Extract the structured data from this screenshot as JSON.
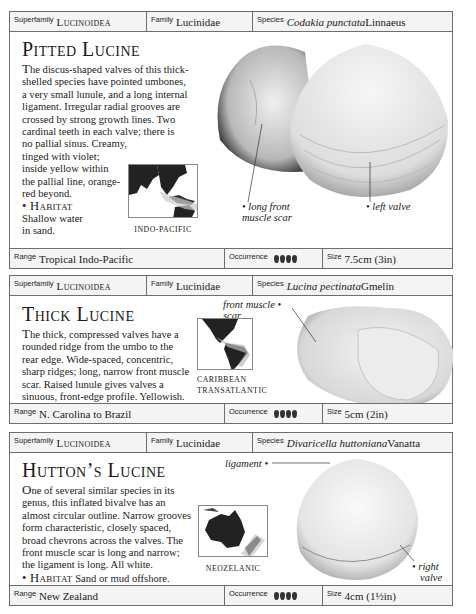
{
  "labels": {
    "superfamily": "Superfamily",
    "family": "Family",
    "species": "Species",
    "range": "Range",
    "occurrence": "Occurrence",
    "size": "Size",
    "habitat": "• Habitat"
  },
  "entries": [
    {
      "superfamily": "Lucinoidea",
      "family": "Lucinidae",
      "species_italic": "Codakia punctata",
      "species_author": " Linnaeus",
      "title": "Pitted Lucine",
      "desc_first": "T",
      "desc_l1": "he discus-shaped valves of this thick-",
      "desc_l2": "shelled species have pointed umbones,",
      "desc_l3": "a very small lunule, and a long internal",
      "desc_l4": "ligament. Irregular radial grooves are",
      "desc_l5": "crossed by strong growth lines. Two",
      "desc_l6": "cardinal teeth in each valve; there is",
      "desc_l7": "no pallial sinus. Creamy,",
      "desc_l8": "tinged with violet;",
      "desc_l9": "inside yellow within",
      "desc_l10": "the pallial line, orange-",
      "desc_l11": "red beyond.",
      "habitat_l1": "Shallow water",
      "habitat_l2": "in sand.",
      "map_label": "INDO-PACIFIC",
      "annotations": [
        "long front",
        "muscle scar",
        "left valve"
      ],
      "range": "Tropical Indo-Pacific",
      "occurrence_count": 4,
      "size": "7.5cm (3in)"
    },
    {
      "superfamily": "Lucinoidea",
      "family": "Lucinidae",
      "species_italic": "Lucina pectinata",
      "species_author": " Gmelin",
      "title": "Thick Lucine",
      "desc_first": "T",
      "desc_l1": "he thick, compressed valves have a",
      "desc_l2": "rounded ridge from the umbo to the",
      "desc_l3": "rear edge. Wide-spaced, concentric,",
      "desc_l4": "sharp ridges; long, narrow front muscle",
      "desc_l5": "scar. Raised lunule gives valves a",
      "desc_l6": "sinuous, front-edge profile. Yellowish.",
      "habitat_text": " Shallow water.",
      "map_label_l1": "CARIBBEAN",
      "map_label_l2": "TRANSATLANTIC",
      "annotations": [
        "front muscle",
        "scar"
      ],
      "range": "N. Carolina to Brazil",
      "occurrence_count": 4,
      "size": "5cm (2in)"
    },
    {
      "superfamily": "Lucinoidea",
      "family": "Lucinidae",
      "species_italic": "Divaricella huttoniana",
      "species_author": " Vanatta",
      "title": "Hutton’s Lucine",
      "desc_first": "O",
      "desc_l1": "ne of several similar species in its",
      "desc_l2": "genus, this inflated bivalve has an",
      "desc_l3": "almost circular outline. Narrow grooves",
      "desc_l4": "form characteristic, closely spaced,",
      "desc_l5": "broad chevrons across the valves. The",
      "desc_l6": "front muscle scar is long and narrow;",
      "desc_l7": "the ligament is long. All white.",
      "habitat_text": " Sand or mud offshore.",
      "map_label": "NEOZELANIC",
      "annotations": [
        "ligament",
        "right",
        "valve"
      ],
      "range": "New Zealand",
      "occurrence_count": 4,
      "size": "4cm (1½in)"
    }
  ]
}
